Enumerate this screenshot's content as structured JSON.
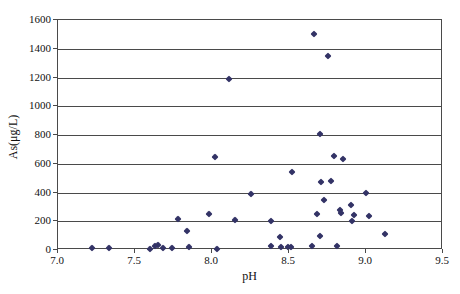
{
  "chart_data": {
    "type": "scatter",
    "title": "",
    "xlabel": "pH",
    "ylabel": "As(μg/L)",
    "xlim": [
      7.0,
      9.5
    ],
    "ylim": [
      0,
      1600
    ],
    "x_ticks": [
      "7.0",
      "7.5",
      "8.0",
      "8.5",
      "9.0",
      "9.5"
    ],
    "x_tick_values": [
      7.0,
      7.5,
      8.0,
      8.5,
      9.0,
      9.5
    ],
    "y_ticks": [
      "0",
      "200",
      "400",
      "600",
      "800",
      "1000",
      "1200",
      "1400",
      "1600"
    ],
    "y_tick_values": [
      0,
      200,
      400,
      600,
      800,
      1000,
      1200,
      1400,
      1600
    ],
    "grid": "horizontal-only",
    "legend": "none",
    "marker": {
      "shape": "diamond",
      "color": "#333366",
      "size_px": 5
    },
    "points": [
      [
        7.22,
        15
      ],
      [
        7.33,
        15
      ],
      [
        7.6,
        10
      ],
      [
        7.63,
        25
      ],
      [
        7.65,
        35
      ],
      [
        7.68,
        15
      ],
      [
        7.74,
        15
      ],
      [
        7.78,
        215
      ],
      [
        7.84,
        130
      ],
      [
        7.85,
        20
      ],
      [
        7.98,
        250
      ],
      [
        8.02,
        650
      ],
      [
        8.03,
        10
      ],
      [
        8.11,
        1190
      ],
      [
        8.15,
        210
      ],
      [
        8.25,
        390
      ],
      [
        8.38,
        200
      ],
      [
        8.38,
        25
      ],
      [
        8.44,
        90
      ],
      [
        8.45,
        18
      ],
      [
        8.49,
        18
      ],
      [
        8.51,
        18
      ],
      [
        8.52,
        540
      ],
      [
        8.65,
        25
      ],
      [
        8.66,
        1500
      ],
      [
        8.68,
        250
      ],
      [
        8.7,
        100
      ],
      [
        8.7,
        810
      ],
      [
        8.71,
        470
      ],
      [
        8.73,
        350
      ],
      [
        8.75,
        1350
      ],
      [
        8.77,
        480
      ],
      [
        8.79,
        655
      ],
      [
        8.81,
        30
      ],
      [
        8.83,
        280
      ],
      [
        8.84,
        260
      ],
      [
        8.85,
        630
      ],
      [
        8.9,
        310
      ],
      [
        8.91,
        205
      ],
      [
        8.92,
        245
      ],
      [
        9.0,
        400
      ],
      [
        9.02,
        240
      ],
      [
        9.12,
        110
      ]
    ]
  },
  "colors": {
    "marker": "#333366",
    "grid": "#4a4a4a",
    "frame": "#4a4a4a",
    "background": "#ffffff",
    "text": "#111111"
  }
}
